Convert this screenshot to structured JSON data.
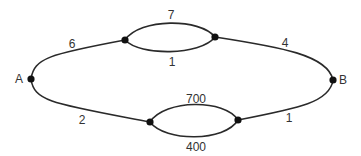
{
  "diagram": {
    "type": "network-graph",
    "colors": {
      "line": "#2a2a2a",
      "node": "#111111",
      "text": "#333333",
      "background": "#ffffff"
    },
    "nodes": {
      "A": {
        "label": "A"
      },
      "B": {
        "label": "B"
      }
    },
    "edges": {
      "a_to_top": {
        "weight": "6"
      },
      "top_upper": {
        "weight": "7"
      },
      "top_lower": {
        "weight": "1"
      },
      "top_to_b": {
        "weight": "4"
      },
      "a_to_bottom": {
        "weight": "2"
      },
      "bottom_upper": {
        "weight": "700"
      },
      "bottom_lower": {
        "weight": "400"
      },
      "bottom_to_b": {
        "weight": "1"
      }
    }
  }
}
